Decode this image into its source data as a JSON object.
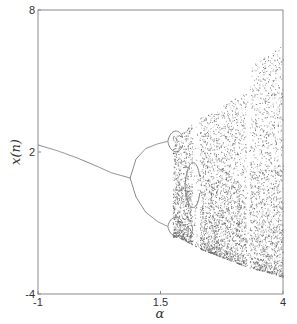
{
  "chart_data": {
    "type": "scatter",
    "title": "",
    "xlabel": "α",
    "ylabel": "x(n)",
    "xlim": [
      -1,
      4
    ],
    "ylim": [
      -4,
      8
    ],
    "grid": false,
    "legend": null,
    "x_ticks": [
      {
        "value": -1,
        "label": "-1"
      },
      {
        "value": 1.5,
        "label": "1.5"
      },
      {
        "value": 4,
        "label": "4"
      }
    ],
    "y_ticks": [
      {
        "value": -4,
        "label": "-4"
      },
      {
        "value": 2,
        "label": "2"
      },
      {
        "value": 8,
        "label": "8"
      }
    ],
    "branches": {
      "period1": [
        [
          -1.0,
          2.3
        ],
        [
          -0.6,
          2.05
        ],
        [
          -0.2,
          1.75
        ],
        [
          0.2,
          1.4
        ],
        [
          0.5,
          1.12
        ],
        [
          0.88,
          0.9
        ]
      ],
      "period2_upper": [
        [
          0.88,
          0.9
        ],
        [
          1.0,
          1.7
        ],
        [
          1.2,
          2.15
        ],
        [
          1.45,
          2.35
        ],
        [
          1.65,
          2.45
        ]
      ],
      "period2_lower": [
        [
          0.88,
          0.9
        ],
        [
          1.0,
          0.1
        ],
        [
          1.2,
          -0.55
        ],
        [
          1.45,
          -0.95
        ],
        [
          1.65,
          -1.15
        ]
      ]
    },
    "chaos_envelope": {
      "upper": [
        [
          1.85,
          2.7
        ],
        [
          2.3,
          3.4
        ],
        [
          2.8,
          4.0
        ],
        [
          3.3,
          4.6
        ],
        [
          3.35,
          5.6
        ],
        [
          3.6,
          5.95
        ],
        [
          4.0,
          6.5
        ]
      ],
      "lower": [
        [
          1.85,
          -1.6
        ],
        [
          2.3,
          -2.1
        ],
        [
          2.8,
          -2.5
        ],
        [
          3.3,
          -2.9
        ],
        [
          3.7,
          -3.1
        ],
        [
          4.0,
          -3.3
        ]
      ]
    },
    "windows": [
      [
        2.15,
        2.3
      ],
      [
        3.25,
        3.32
      ]
    ]
  }
}
